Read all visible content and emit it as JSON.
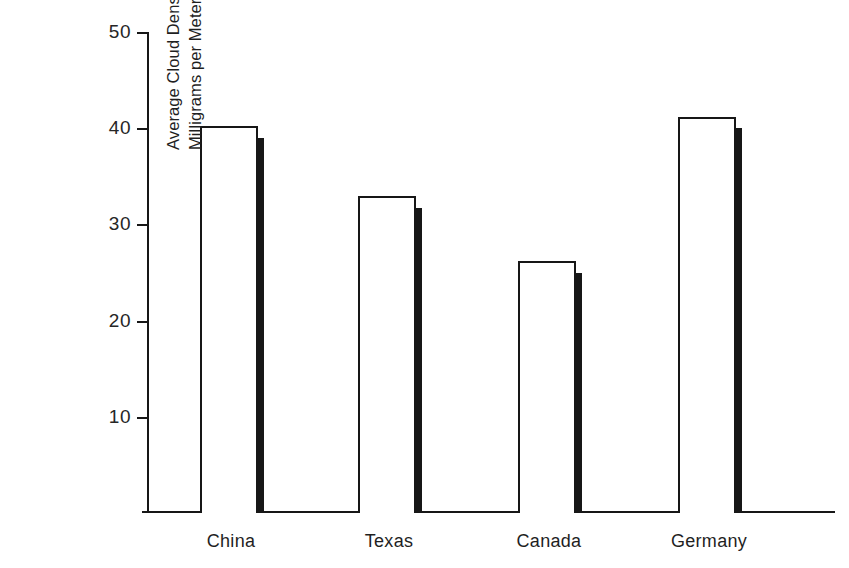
{
  "title_clipped": "Figure 2. Cloud density per region graph",
  "chart_data": {
    "type": "bar",
    "title": "",
    "xlabel": "",
    "ylabel_lines": [
      "Average Cloud Density in",
      "Milligrams per Meter in July"
    ],
    "ylabel": "Average Cloud Density in Milligrams per Meter in July",
    "categories": [
      "China",
      "Texas",
      "Canada",
      "Germany"
    ],
    "ylim": [
      0,
      50
    ],
    "yticks": [
      10,
      20,
      30,
      40,
      50
    ],
    "ytick_labels": [
      "10",
      "20",
      "30",
      "40",
      "50"
    ],
    "grid": false,
    "legend": "none",
    "series": [
      {
        "name": "front-outline",
        "style": "white-fill-black-outline",
        "values": [
          40.2,
          33.0,
          26.2,
          41.2
        ]
      },
      {
        "name": "back-solid",
        "style": "black-fill",
        "values": [
          39.0,
          31.7,
          25.0,
          40.0
        ]
      }
    ],
    "colors": {
      "outline": "#171717",
      "front_fill": "#ffffff",
      "back_fill": "#171717",
      "axis": "#171717",
      "background": "#ffffff",
      "text": "#1f1f1f"
    }
  },
  "geometry": {
    "front_bar_width": 58,
    "back_bar_width": 8,
    "group_left_offsets": [
      53,
      211,
      371,
      531
    ]
  }
}
